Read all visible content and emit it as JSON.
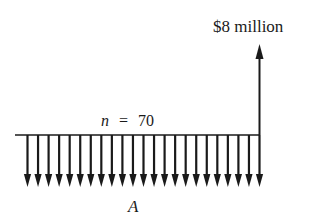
{
  "diagram": {
    "type": "cash-flow-diagram",
    "future_value_label": "$8 million",
    "period_label": "n = 70",
    "period_var": "n",
    "period_eq": "=",
    "period_value": "70",
    "annuity_label": "A",
    "annuity_arrow_count": 23,
    "colors": {
      "ink": "#1a1a1a",
      "background": "#ffffff"
    }
  }
}
